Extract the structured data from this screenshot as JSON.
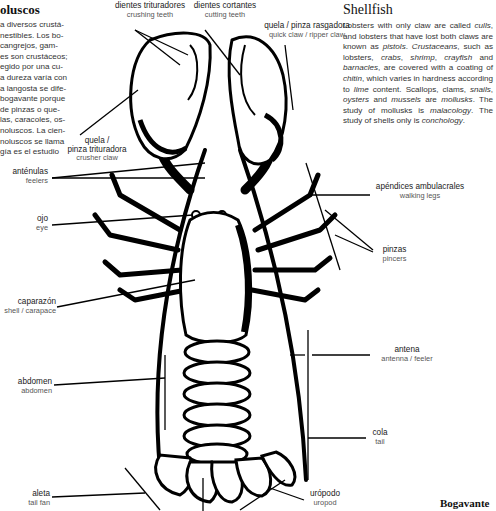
{
  "left_column": {
    "heading": "oluscos",
    "lines": [
      "a diversos crustá-",
      "nestibles. Los bo-",
      " cangrejos, gam-",
      "es son crustáceos;",
      "egido por una cu-",
      "a dureza varía con",
      "a langosta se dife-",
      "bogavante porque",
      " de pinzas o que-",
      "las, caracoles, os-",
      "noluscos. La cien-",
      "noluscos se llama",
      "gía es el estudio"
    ]
  },
  "right_column": {
    "heading": "Shellfish",
    "paragraph_parts": [
      {
        "t": "Lobsters with only claw are called ",
        "i": false
      },
      {
        "t": "culls",
        "i": true
      },
      {
        "t": ", and lobsters that have lost both claws are known as ",
        "i": false
      },
      {
        "t": "pistols",
        "i": true
      },
      {
        "t": ". ",
        "i": false
      },
      {
        "t": "Crustaceans",
        "i": true
      },
      {
        "t": ", such as lobsters, ",
        "i": false
      },
      {
        "t": "crabs",
        "i": true
      },
      {
        "t": ", ",
        "i": false
      },
      {
        "t": "shrimp",
        "i": true
      },
      {
        "t": ", ",
        "i": false
      },
      {
        "t": "crayfish",
        "i": true
      },
      {
        "t": " and ",
        "i": false
      },
      {
        "t": "barnacles",
        "i": true
      },
      {
        "t": ", are covered with a coating of ",
        "i": false
      },
      {
        "t": "chitin",
        "i": true
      },
      {
        "t": ", which varies in hardness according to ",
        "i": false
      },
      {
        "t": "lime",
        "i": true
      },
      {
        "t": " content. Scallops, clams, ",
        "i": false
      },
      {
        "t": "snails",
        "i": true
      },
      {
        "t": ", ",
        "i": false
      },
      {
        "t": "oysters",
        "i": true
      },
      {
        "t": " and ",
        "i": false
      },
      {
        "t": "mussels",
        "i": true
      },
      {
        "t": " are ",
        "i": false
      },
      {
        "t": "mollusks",
        "i": true
      },
      {
        "t": ". The study of mollusks is ",
        "i": false
      },
      {
        "t": "malacology",
        "i": true
      },
      {
        "t": ". The study of shells only is ",
        "i": false
      },
      {
        "t": "conchology",
        "i": true
      },
      {
        "t": ".",
        "i": false
      }
    ]
  },
  "labels": {
    "crushing_teeth": {
      "es": "dientes trituradores",
      "en": "crushing teeth"
    },
    "cutting_teeth": {
      "es": "dientes cortantes",
      "en": "cutting teeth"
    },
    "ripper_claw": {
      "es": "quela / pinza rasgadora",
      "en": "quick claw / ripper claw"
    },
    "crusher_claw": {
      "es1": "quela /",
      "es2": "pinza trituradora",
      "en": "crusher claw"
    },
    "feelers": {
      "es": "anténulas",
      "en": "feelers"
    },
    "eye": {
      "es": "ojo",
      "en": "eye"
    },
    "walking_legs": {
      "es": "apéndices ambulacrales",
      "en": "walking legs"
    },
    "pincers": {
      "es": "pinzas",
      "en": "pincers"
    },
    "carapace": {
      "es": "caparazón",
      "en": "shell / carapace"
    },
    "antenna": {
      "es": "antena",
      "en": "antenna / feeler"
    },
    "abdomen": {
      "es": "abdomen",
      "en": "abdomen"
    },
    "tail": {
      "es": "cola",
      "en": "tail"
    },
    "tail_fan": {
      "es": "aleta",
      "en": "tail fan"
    },
    "uropod": {
      "es": "urópodo",
      "en": "uropod"
    }
  },
  "footer": {
    "title": "Bogavante"
  }
}
